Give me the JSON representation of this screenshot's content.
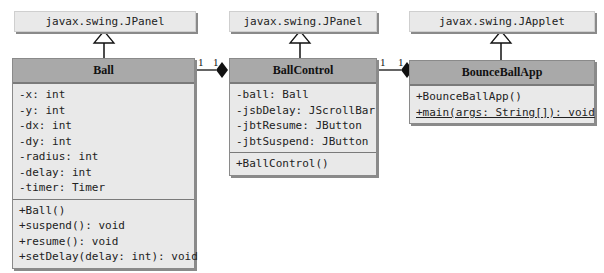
{
  "diagram": {
    "type": "UML class diagram",
    "superclasses": [
      {
        "id": "super-ball",
        "label": "javax.swing.JPanel"
      },
      {
        "id": "super-ballcontrol",
        "label": "javax.swing.JPanel"
      },
      {
        "id": "super-bounceballapp",
        "label": "javax.swing.JApplet"
      }
    ],
    "classes": [
      {
        "name": "Ball",
        "fields": [
          "-x: int",
          "-y: int",
          "-dx: int",
          "-dy: int",
          "-radius: int",
          "-delay: int",
          "-timer: Timer"
        ],
        "methods": [
          "+Ball()",
          "+suspend(): void",
          "+resume(): void",
          "+setDelay(delay: int): void"
        ]
      },
      {
        "name": "BallControl",
        "fields": [
          "-ball: Ball",
          "-jsbDelay: JScrollBar",
          "-jbtResume: JButton",
          "-jbtSuspend: JButton"
        ],
        "methods": [
          "+BallControl()"
        ]
      },
      {
        "name": "BounceBallApp",
        "fields": [],
        "methods": [
          "+BounceBallApp()",
          "+main(args: String[]): void"
        ]
      }
    ],
    "associations": [
      {
        "from": "Ball",
        "to": "BallControl",
        "kind": "composition",
        "mult_from": "1",
        "mult_to": "1"
      },
      {
        "from": "BallControl",
        "to": "BounceBallApp",
        "kind": "composition",
        "mult_from": "1",
        "mult_to": "1"
      }
    ]
  }
}
